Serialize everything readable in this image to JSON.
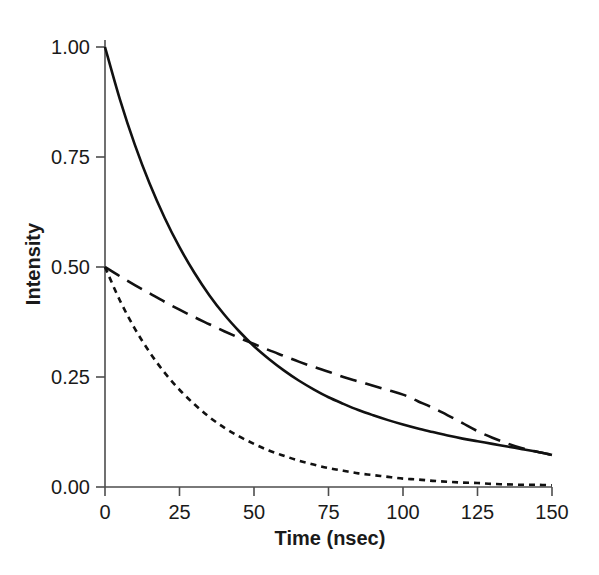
{
  "chart_data": {
    "type": "line",
    "title": "",
    "subtitle": "",
    "xlabel": "Time (nsec)",
    "ylabel": "Intensity",
    "xlim": [
      0,
      150
    ],
    "ylim": [
      0.0,
      1.0
    ],
    "xticks": [
      0,
      25,
      50,
      75,
      100,
      125,
      150
    ],
    "xticklabels": [
      "0",
      "25",
      "50",
      "75",
      "100",
      "125",
      "150"
    ],
    "yticks": [
      0.0,
      0.25,
      0.5,
      0.75,
      1.0
    ],
    "yticklabels": [
      "0.00",
      "0.25",
      "0.50",
      "0.75",
      "1.00"
    ],
    "grid": false,
    "legend": "none",
    "annotations": [],
    "series": [
      {
        "name": "total-decay",
        "style": "solid",
        "color": "#111111",
        "linewidth": 2.6,
        "x": [
          0,
          5,
          10,
          15,
          20,
          25,
          30,
          35,
          40,
          45,
          50,
          55,
          60,
          65,
          70,
          75,
          80,
          85,
          90,
          95,
          100,
          105,
          110,
          115,
          120,
          125,
          130,
          135,
          140,
          145,
          150
        ],
        "y": [
          1.0,
          0.881,
          0.778,
          0.689,
          0.612,
          0.545,
          0.487,
          0.436,
          0.392,
          0.354,
          0.32,
          0.291,
          0.265,
          0.242,
          0.222,
          0.204,
          0.189,
          0.175,
          0.163,
          0.152,
          0.142,
          0.133,
          0.125,
          0.117,
          0.11,
          0.104,
          0.098,
          0.092,
          0.086,
          0.08,
          0.073
        ]
      },
      {
        "name": "slow-component",
        "style": "long-dash",
        "color": "#111111",
        "linewidth": 2.6,
        "dasharray": "17,9",
        "x": [
          0,
          5,
          10,
          15,
          20,
          25,
          30,
          35,
          40,
          45,
          50,
          55,
          60,
          65,
          70,
          75,
          80,
          85,
          90,
          95,
          100,
          105,
          110,
          115,
          120,
          125,
          130,
          135,
          140,
          145,
          150
        ],
        "y": [
          0.5,
          0.479,
          0.459,
          0.44,
          0.421,
          0.403,
          0.386,
          0.37,
          0.354,
          0.339,
          0.325,
          0.311,
          0.298,
          0.285,
          0.273,
          0.262,
          0.25,
          0.24,
          0.23,
          0.22,
          0.21,
          0.195,
          0.18,
          0.163,
          0.145,
          0.127,
          0.112,
          0.099,
          0.088,
          0.08,
          0.073
        ]
      },
      {
        "name": "fast-component",
        "style": "short-dash",
        "color": "#111111",
        "linewidth": 2.6,
        "dasharray": "6,5",
        "x": [
          0,
          5,
          10,
          15,
          20,
          25,
          30,
          35,
          40,
          45,
          50,
          55,
          60,
          65,
          70,
          75,
          80,
          85,
          90,
          95,
          100,
          105,
          110,
          115,
          120,
          125,
          130,
          135,
          140,
          145,
          150
        ],
        "y": [
          0.5,
          0.424,
          0.36,
          0.306,
          0.26,
          0.221,
          0.188,
          0.159,
          0.135,
          0.115,
          0.098,
          0.083,
          0.071,
          0.06,
          0.051,
          0.043,
          0.037,
          0.031,
          0.027,
          0.023,
          0.019,
          0.017,
          0.014,
          0.012,
          0.01,
          0.009,
          0.007,
          0.006,
          0.005,
          0.005,
          0.004
        ]
      }
    ]
  },
  "figure": {
    "background": "#ffffff",
    "axis_color": "#4d4d4d",
    "line_color": "#111111"
  }
}
